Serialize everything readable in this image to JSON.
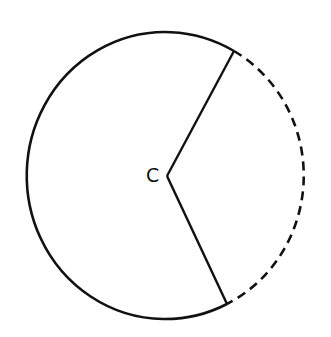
{
  "diagram": {
    "type": "circle-with-sector",
    "center_label": "C",
    "stroke_color": "#111111",
    "background": "#ffffff",
    "circle": {
      "cx": 166,
      "cy": 176,
      "rx": 138.5,
      "ry": 143.5
    },
    "radii": [
      {
        "from": [
          167,
          176
        ],
        "to": [
          234,
          51
        ]
      },
      {
        "from": [
          167,
          176
        ],
        "to": [
          227,
          304
        ]
      }
    ],
    "arcs": [
      {
        "style": "solid",
        "description": "major arc"
      },
      {
        "style": "dashed",
        "description": "minor arc"
      }
    ]
  }
}
